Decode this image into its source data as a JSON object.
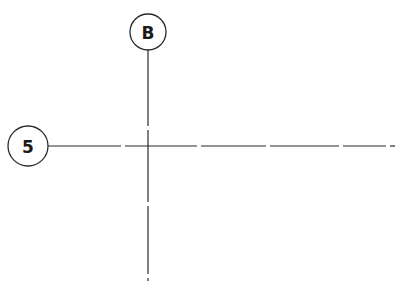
{
  "diagram": {
    "type": "structural-grid-layout",
    "line_color": "#2a2a2a",
    "background": "#ffffff",
    "gridlines": [
      {
        "id": "B",
        "orientation": "vertical",
        "label": "B",
        "bubble": {
          "cx": 148,
          "cy": 32,
          "r": 18
        },
        "x": 148,
        "y_start": 50,
        "y_end": 281,
        "gaps": [
          128,
          204,
          276
        ]
      },
      {
        "id": "5",
        "orientation": "horizontal",
        "label": "5",
        "bubble": {
          "cx": 28,
          "cy": 146,
          "r": 20
        },
        "y": 146,
        "x_start": 48,
        "x_end": 395,
        "gaps": [
          123,
          199,
          268,
          341,
          388
        ]
      }
    ]
  }
}
